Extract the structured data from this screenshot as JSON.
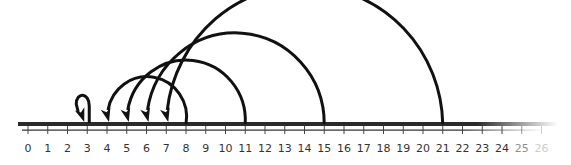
{
  "number_line": {
    "start": 0,
    "end": 26,
    "labels": [
      "0",
      "1",
      "2",
      "3",
      "4",
      "5",
      "6",
      "7",
      "8",
      "9",
      "10",
      "11",
      "12",
      "13",
      "14",
      "15",
      "16",
      "17",
      "18",
      "19",
      "20",
      "21",
      "22",
      "23",
      "24",
      "25",
      "26"
    ],
    "line_color": "#2a2a2a",
    "arc_color": "#111111"
  },
  "jumps": [
    {
      "from": 3,
      "to": 3,
      "kind": "loop"
    },
    {
      "from": 8,
      "to": 4,
      "kind": "arc"
    },
    {
      "from": 11,
      "to": 5,
      "kind": "arc"
    },
    {
      "from": 15,
      "to": 6,
      "kind": "arc"
    },
    {
      "from": 21,
      "to": 7,
      "kind": "arc"
    }
  ]
}
